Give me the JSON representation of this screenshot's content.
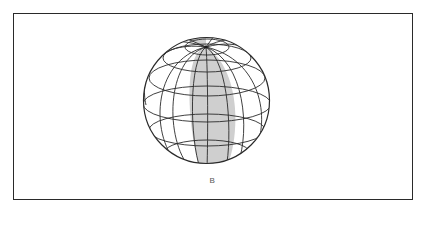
{
  "figure": {
    "caption": "B",
    "globe": {
      "cx": 206.5,
      "cy": 100.5,
      "r": 63,
      "pole": {
        "x": 206,
        "y": 47
      },
      "stroke": "#2a2a2a",
      "band_fill": "#cfcfcf",
      "background": "#ffffff"
    }
  }
}
